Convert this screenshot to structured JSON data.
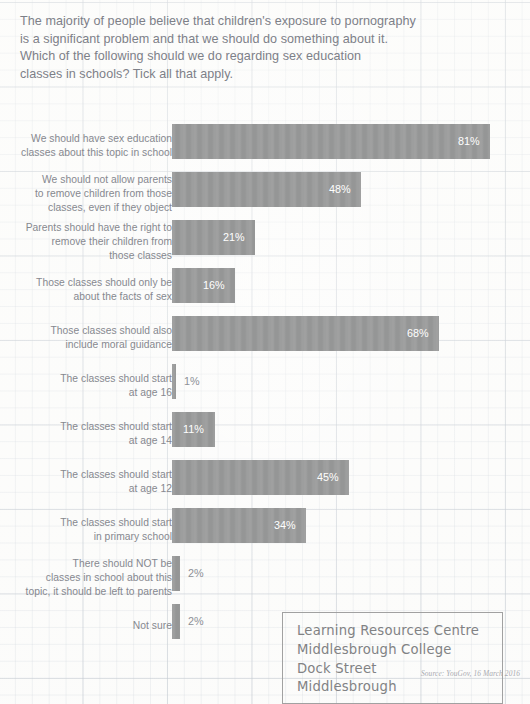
{
  "question": {
    "lines": [
      "The majority of people believe that children's exposure to pornography",
      "is a significant problem and that we should do something about it.",
      "Which of the following should we do regarding sex education",
      "classes in schools? Tick all that apply."
    ]
  },
  "source_note": "Source: YouGov, 16 March 2016",
  "stamp": {
    "lines": [
      "Learning Resources Centre",
      "Middlesbrough College",
      "Dock Street",
      "Middlesbrough"
    ]
  },
  "chart_data": {
    "type": "bar",
    "orientation": "horizontal",
    "xlabel": "",
    "ylabel": "",
    "xlim": [
      0,
      100
    ],
    "grid": true,
    "legend": false,
    "bar_color": "#9a9b9b",
    "value_suffix": "%",
    "categories": [
      "We should have sex education classes about this topic in school",
      "We should not allow parents to remove children from those classes, even if they object",
      "Parents should have the right to remove their children from those classes",
      "Those classes should only be about the facts of sex",
      "Those classes should also include moral guidance",
      "The classes should start at age 16",
      "The classes should start at age 14",
      "The classes should start at age 12",
      "The classes should start in primary school",
      "There should NOT be classes in school about this topic, it should be left to parents",
      "Not sure"
    ],
    "values": [
      81,
      48,
      21,
      16,
      68,
      1,
      11,
      45,
      34,
      2,
      2
    ]
  },
  "rows": [
    {
      "label_lines": [
        "We should have sex education",
        "classes about this topic in school"
      ],
      "value": 81,
      "value_label": "81%",
      "top": 14,
      "label_top": 22,
      "value_inside": true
    },
    {
      "label_lines": [
        "We should not allow parents",
        "to remove children from those",
        "classes, even if they object"
      ],
      "value": 48,
      "value_label": "48%",
      "top": 62,
      "label_top": 63,
      "value_inside": true
    },
    {
      "label_lines": [
        "Parents should have the right to",
        "remove their children from",
        "those classes"
      ],
      "value": 21,
      "value_label": "21%",
      "top": 110,
      "label_top": 111,
      "value_inside": true
    },
    {
      "label_lines": [
        "Those classes should only be",
        "about the facts of sex"
      ],
      "value": 16,
      "value_label": "16%",
      "top": 158,
      "label_top": 166,
      "value_inside": true
    },
    {
      "label_lines": [
        "Those classes should also",
        "include moral guidance"
      ],
      "value": 68,
      "value_label": "68%",
      "top": 206,
      "label_top": 214,
      "value_inside": true
    },
    {
      "label_lines": [
        "The classes should start",
        "at age 16"
      ],
      "value": 1,
      "value_label": "1%",
      "top": 254,
      "label_top": 262,
      "value_inside": false
    },
    {
      "label_lines": [
        "The classes should start",
        "at age 14"
      ],
      "value": 11,
      "value_label": "11%",
      "top": 302,
      "label_top": 310,
      "value_inside": true
    },
    {
      "label_lines": [
        "The classes should start",
        "at age 12"
      ],
      "value": 45,
      "value_label": "45%",
      "top": 350,
      "label_top": 358,
      "value_inside": true
    },
    {
      "label_lines": [
        "The classes should start",
        "in primary school"
      ],
      "value": 34,
      "value_label": "34%",
      "top": 398,
      "label_top": 406,
      "value_inside": true
    },
    {
      "label_lines": [
        "There should NOT be",
        "classes in school about this",
        "topic, it should be left to parents"
      ],
      "value": 2,
      "value_label": "2%",
      "top": 446,
      "label_top": 447,
      "value_inside": false
    },
    {
      "label_lines": [
        "Not sure"
      ],
      "value": 2,
      "value_label": "2%",
      "top": 494,
      "label_top": 509,
      "value_inside": false
    }
  ]
}
